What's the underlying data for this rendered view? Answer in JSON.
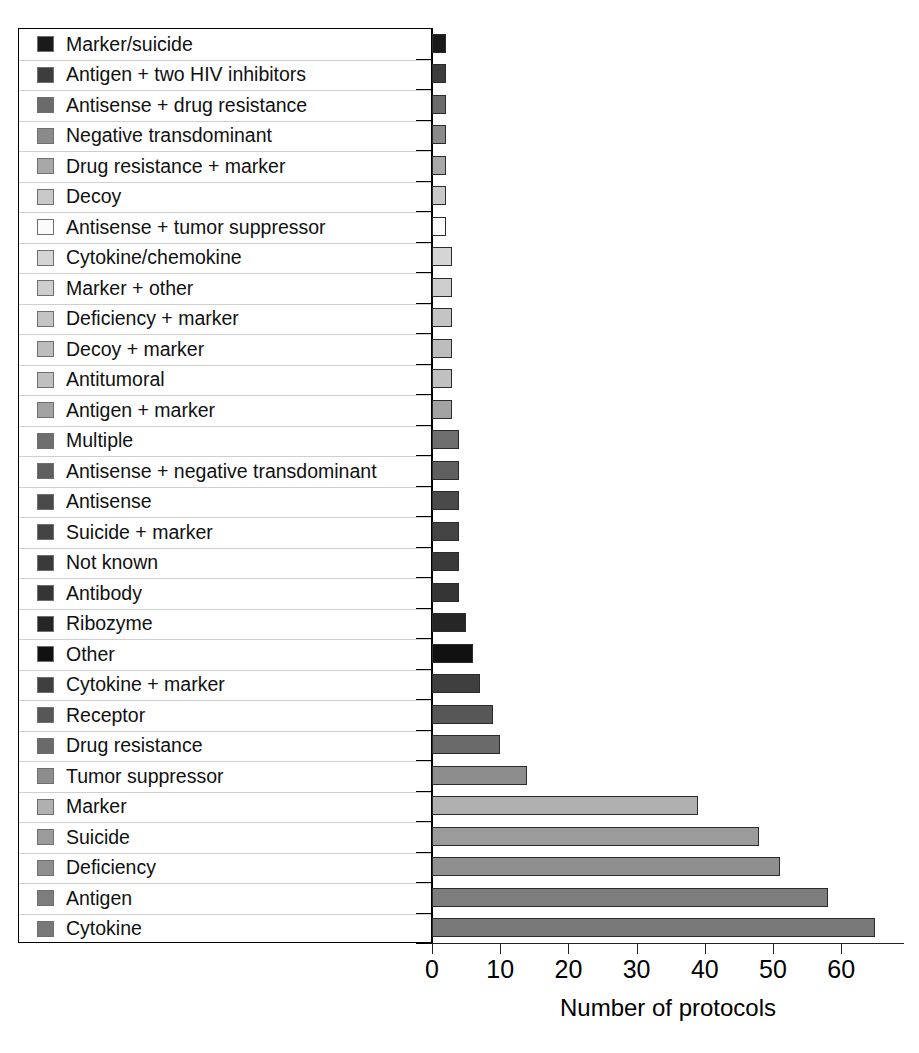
{
  "chart_data": {
    "type": "bar",
    "orientation": "horizontal",
    "title": "",
    "xlabel": "Number of protocols",
    "ylabel": "",
    "xlim": [
      0,
      69
    ],
    "xticks": [
      0,
      10,
      20,
      30,
      40,
      50,
      60
    ],
    "grid": false,
    "legend_position": "left-inline",
    "categories": [
      "Marker/suicide",
      "Antigen + two HIV inhibitors",
      "Antisense + drug resistance",
      "Negative transdominant",
      "Drug resistance + marker",
      "Decoy",
      "Antisense + tumor suppressor",
      "Cytokine/chemokine",
      "Marker + other",
      "Deficiency + marker",
      "Decoy + marker",
      "Antitumoral",
      "Antigen + marker",
      "Multiple",
      "Antisense + negative transdominant",
      "Antisense",
      "Suicide + marker",
      "Not known",
      "Antibody",
      "Ribozyme",
      "Other",
      "Cytokine + marker",
      "Receptor",
      "Drug resistance",
      "Tumor suppressor",
      "Marker",
      "Suicide",
      "Deficiency",
      "Antigen",
      "Cytokine"
    ],
    "values": [
      2,
      2,
      2,
      2,
      2,
      2,
      2,
      3,
      3,
      3,
      3,
      3,
      3,
      4,
      4,
      4,
      4,
      4,
      4,
      5,
      6,
      7,
      9,
      10,
      14,
      39,
      48,
      51,
      58,
      65
    ],
    "colors": [
      "#1a1a1a",
      "#3d3d3d",
      "#6b6b6b",
      "#8a8a8a",
      "#a8a8a8",
      "#c9c9c9",
      "#fbfbfb",
      "#d5d5d5",
      "#cdcdcd",
      "#c4c4c4",
      "#bdbdbd",
      "#c0c0c0",
      "#a3a3a3",
      "#6e6e6e",
      "#5f5f5f",
      "#4a4a4a",
      "#444444",
      "#3a3a3a",
      "#353535",
      "#262626",
      "#111111",
      "#3f3f3f",
      "#575757",
      "#6a6a6a",
      "#8d8d8d",
      "#b0b0b0",
      "#9b9b9b",
      "#8f8f8f",
      "#7d7d7d",
      "#787878"
    ]
  },
  "axis": {
    "x_label": "Number of protocols",
    "tick_labels": [
      "0",
      "10",
      "20",
      "30",
      "40",
      "50",
      "60"
    ]
  }
}
